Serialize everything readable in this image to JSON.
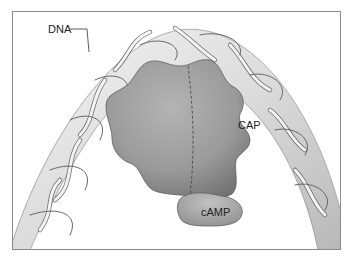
{
  "figure": {
    "labels": {
      "dna": "DNA",
      "cap": "CAP",
      "camp": "cAMP"
    },
    "colors": {
      "background": "#ffffff",
      "frame": "#8a8a8a",
      "dna_tube": "#e4e4e4",
      "dna_strand_light": "#f2f2f2",
      "dna_strand_dark": "#6e6e6e",
      "protein": "#9c9c9c",
      "protein_shadow": "#7a7a7a",
      "camp": "#a9a9a9"
    }
  }
}
